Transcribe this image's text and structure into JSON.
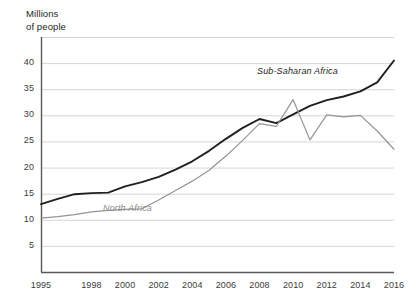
{
  "chart_data": {
    "type": "line",
    "title": "",
    "subtitle": "",
    "ylabel": "Millions\nof people",
    "xlabel": "",
    "ylim": [
      0,
      45
    ],
    "xlim": [
      1995,
      2016
    ],
    "grid": true,
    "grid_axis": "y",
    "legend": "inline-labels",
    "ytick_labels": [
      "5",
      "10",
      "15",
      "20",
      "25",
      "30",
      "35",
      "40"
    ],
    "ytick_values": [
      5,
      10,
      15,
      20,
      25,
      30,
      35,
      40
    ],
    "xtick_labels": [
      "1995",
      "1998",
      "2000",
      "2002",
      "2004",
      "2006",
      "2008",
      "2010",
      "2012",
      "2014",
      "2016"
    ],
    "xtick_values": [
      1995,
      1998,
      2000,
      2002,
      2004,
      2006,
      2008,
      2010,
      2012,
      2014,
      2016
    ],
    "x": [
      1995,
      1996,
      1997,
      1998,
      1999,
      2000,
      2001,
      2002,
      2003,
      2004,
      2005,
      2006,
      2007,
      2008,
      2009,
      2010,
      2011,
      2012,
      2013,
      2014,
      2015,
      2016
    ],
    "series": [
      {
        "name": "Sub-Saharan Africa",
        "color": "#231f20",
        "label_x": 2009.0,
        "label_y": 36.5,
        "values": [
          13.0,
          14.0,
          14.9,
          15.1,
          15.2,
          16.4,
          17.2,
          18.2,
          19.6,
          21.2,
          23.2,
          25.5,
          27.6,
          29.3,
          28.5,
          30.2,
          31.8,
          32.9,
          33.6,
          34.6,
          36.3,
          40.5
        ]
      },
      {
        "name": "North Africa",
        "color": "#949494",
        "label_x": 2000.3,
        "label_y": 11.6,
        "values": [
          10.3,
          10.6,
          11.0,
          11.5,
          11.8,
          12.0,
          12.1,
          13.8,
          15.6,
          17.4,
          19.5,
          22.2,
          25.2,
          28.4,
          27.9,
          33.0,
          25.3,
          30.1,
          29.7,
          30.0,
          27.0,
          23.5
        ]
      }
    ]
  },
  "plot_geometry": {
    "left": 41,
    "right": 394,
    "top": 37,
    "bottom": 272
  }
}
